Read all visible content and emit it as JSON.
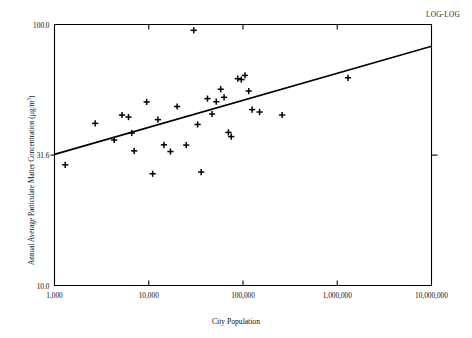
{
  "annotation": {
    "log_log": "LOG-LOG"
  },
  "chart_data": {
    "type": "scatter",
    "title": "",
    "annotation": "LOG-LOG",
    "xlabel": "City Population",
    "ylabel": "Annual Average Particulate Matter Concentration (µg/m³)",
    "ylabel_prefix": "Annual Average Particulate Matter Concentration (µg/m",
    "ylabel_exponent": "3",
    "ylabel_suffix": ")",
    "xscale": "log",
    "yscale": "log",
    "xlim": [
      1000,
      10000000
    ],
    "ylim": [
      10.0,
      100.0
    ],
    "grid": false,
    "legend": null,
    "xticks": [
      1000,
      10000,
      100000,
      1000000,
      10000000
    ],
    "xtick_labels": [
      "1,000",
      "10,000",
      "100,000",
      "1,000,000",
      "10,000,000"
    ],
    "yticks": [
      10.0,
      31.6,
      100.0
    ],
    "ytick_labels": [
      "10.0",
      "31.6",
      "100.0"
    ],
    "marker": "plus",
    "points": [
      {
        "x": 1300,
        "y": 29.0
      },
      {
        "x": 2700,
        "y": 41.8
      },
      {
        "x": 4300,
        "y": 36.1
      },
      {
        "x": 5200,
        "y": 45.0
      },
      {
        "x": 6100,
        "y": 44.2
      },
      {
        "x": 6600,
        "y": 38.4
      },
      {
        "x": 7000,
        "y": 32.8
      },
      {
        "x": 9500,
        "y": 50.5
      },
      {
        "x": 11000,
        "y": 26.8
      },
      {
        "x": 12500,
        "y": 43.2
      },
      {
        "x": 14500,
        "y": 34.6
      },
      {
        "x": 17000,
        "y": 32.6
      },
      {
        "x": 20000,
        "y": 48.5
      },
      {
        "x": 25000,
        "y": 34.5
      },
      {
        "x": 30000,
        "y": 95.0
      },
      {
        "x": 33000,
        "y": 41.4
      },
      {
        "x": 36000,
        "y": 27.2
      },
      {
        "x": 42000,
        "y": 52.0
      },
      {
        "x": 47000,
        "y": 45.4
      },
      {
        "x": 52000,
        "y": 50.6
      },
      {
        "x": 58000,
        "y": 56.5
      },
      {
        "x": 63000,
        "y": 52.6
      },
      {
        "x": 70000,
        "y": 38.6
      },
      {
        "x": 75000,
        "y": 37.2
      },
      {
        "x": 88000,
        "y": 62.0
      },
      {
        "x": 96000,
        "y": 61.5
      },
      {
        "x": 105000,
        "y": 63.8
      },
      {
        "x": 115000,
        "y": 55.6
      },
      {
        "x": 125000,
        "y": 47.2
      },
      {
        "x": 150000,
        "y": 46.2
      },
      {
        "x": 260000,
        "y": 45.0
      },
      {
        "x": 1300000,
        "y": 62.5
      }
    ],
    "trend_line": {
      "type": "linear-on-log-log",
      "x_start": 1000,
      "y_start": 31.8,
      "x_end": 10000000,
      "y_end": 82.5
    }
  }
}
